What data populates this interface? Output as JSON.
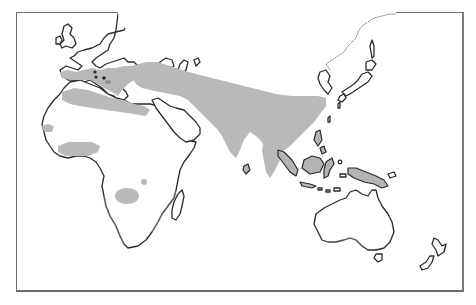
{
  "map": {
    "type": "species distribution range map",
    "style": "black-and-white stippled outline map",
    "region_shown": "Old World: Europe, Africa, Asia, Australia, New Zealand",
    "labels": [],
    "colors": {
      "background": "#ffffff",
      "frame": "#6e6e6e",
      "coastline": "#2a2a2a",
      "range_fill": "#b9b9b9"
    },
    "range_areas": [
      {
        "name": "Southern Europe & Mediterranean"
      },
      {
        "name": "North African coastal belt"
      },
      {
        "name": "Middle East, Iran & Central Asia band"
      },
      {
        "name": "Indian subcontinent"
      },
      {
        "name": "Southern China & Indochina"
      },
      {
        "name": "Indonesian & New Guinea islands"
      },
      {
        "name": "West African coastal patch"
      },
      {
        "name": "West African Sahel band"
      },
      {
        "name": "Central-southern African patch"
      },
      {
        "name": "Small East African spot"
      }
    ]
  }
}
